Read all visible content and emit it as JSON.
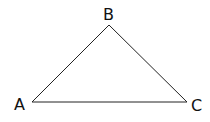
{
  "diagram": {
    "type": "triangle",
    "stroke_color": "#222222",
    "vertices": [
      {
        "name": "A",
        "x": 32,
        "y": 102,
        "label_x": 14,
        "label_y": 110
      },
      {
        "name": "B",
        "x": 109,
        "y": 25,
        "label_x": 103,
        "label_y": 20
      },
      {
        "name": "C",
        "x": 187,
        "y": 102,
        "label_x": 191,
        "label_y": 111
      }
    ],
    "edges": [
      [
        "A",
        "B"
      ],
      [
        "B",
        "C"
      ],
      [
        "C",
        "A"
      ]
    ]
  }
}
